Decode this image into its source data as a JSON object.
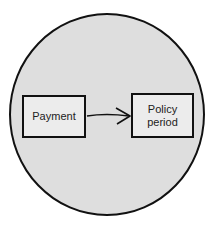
{
  "diagram": {
    "nodes": [
      {
        "id": "payment",
        "label": "Payment"
      },
      {
        "id": "policy-period",
        "label": "Policy\nperiod",
        "line1": "Policy",
        "line2": "period"
      }
    ],
    "edges": [
      {
        "from": "payment",
        "to": "policy-period",
        "type": "arrow"
      }
    ],
    "colors": {
      "circle_fill": "#dedede",
      "box_fill": "#ececec",
      "stroke": "#111111"
    }
  }
}
